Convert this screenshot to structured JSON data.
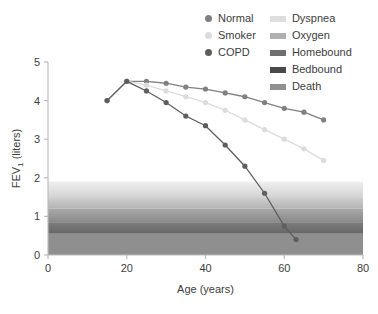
{
  "chart_data": {
    "type": "line",
    "title": "",
    "xlabel": "Age (years)",
    "ylabel": "FEV",
    "ylabel_sub": "1",
    "ylabel_unit": " (liters)",
    "xlim": [
      0,
      80
    ],
    "ylim": [
      0,
      5
    ],
    "xticks": [
      0,
      20,
      40,
      60,
      80
    ],
    "yticks": [
      0,
      1,
      2,
      3,
      4,
      5
    ],
    "grid": false,
    "legend_position": "top-right",
    "series": [
      {
        "name": "Normal",
        "color": "#808080",
        "marker": "circle",
        "x": [
          15,
          20,
          25,
          30,
          35,
          40,
          45,
          50,
          55,
          60,
          65,
          70
        ],
        "y": [
          4.0,
          4.5,
          4.5,
          4.45,
          4.35,
          4.3,
          4.2,
          4.1,
          3.95,
          3.8,
          3.7,
          3.5
        ]
      },
      {
        "name": "Smoker",
        "color": "#dcdcdc",
        "marker": "circle",
        "x": [
          15,
          20,
          25,
          30,
          35,
          40,
          45,
          50,
          55,
          60,
          65,
          70
        ],
        "y": [
          4.0,
          4.5,
          4.4,
          4.25,
          4.1,
          3.95,
          3.75,
          3.5,
          3.25,
          3.0,
          2.75,
          2.45
        ]
      },
      {
        "name": "COPD",
        "color": "#5e5e5e",
        "marker": "circle",
        "x": [
          15,
          20,
          25,
          30,
          35,
          40,
          45,
          50,
          55,
          60,
          63
        ],
        "y": [
          4.0,
          4.5,
          4.25,
          3.95,
          3.6,
          3.35,
          2.85,
          2.3,
          1.6,
          0.75,
          0.4
        ]
      }
    ],
    "bands": [
      {
        "label": "Dyspnea",
        "y_top": 1.9,
        "y_bottom": 1.5,
        "color_top": "#efefef",
        "color_bottom": "#d4d4d4"
      },
      {
        "label": "Oxygen",
        "y_top": 1.5,
        "y_bottom": 1.2,
        "color_top": "#cfcfcf",
        "color_bottom": "#b4b4b4"
      },
      {
        "label": "Homebound",
        "y_top": 1.2,
        "y_bottom": 0.85,
        "color_top": "#a8a8a8",
        "color_bottom": "#8a8a8a"
      },
      {
        "label": "Bedbound",
        "y_top": 0.85,
        "y_bottom": 0.55,
        "color_top": "#7d7d7d",
        "color_bottom": "#666666"
      },
      {
        "label": "Death",
        "y_top": 0.55,
        "y_bottom": 0.0,
        "color_top": "#8f8f8f",
        "color_bottom": "#8f8f8f"
      }
    ]
  },
  "legend": {
    "series_entries": [
      {
        "label": "Normal",
        "color": "#808080"
      },
      {
        "label": "Smoker",
        "color": "#dcdcdc"
      },
      {
        "label": "COPD",
        "color": "#5e5e5e"
      }
    ],
    "band_entries": [
      {
        "label": "Dyspnea",
        "color": "#dedede"
      },
      {
        "label": "Oxygen",
        "color": "#b0b0b0"
      },
      {
        "label": "Homebound",
        "color": "#6f6f6f"
      },
      {
        "label": "Bedbound",
        "color": "#4a4a4a"
      },
      {
        "label": "Death",
        "color": "#909090"
      }
    ]
  },
  "axes": {
    "x_title": "Age (years)",
    "y_title_main": "FEV",
    "y_title_sub": "1",
    "y_title_unit": " (liters)",
    "x_tick_labels": [
      "0",
      "20",
      "40",
      "60",
      "80"
    ],
    "y_tick_labels": [
      "0",
      "1",
      "2",
      "3",
      "4",
      "5"
    ]
  }
}
